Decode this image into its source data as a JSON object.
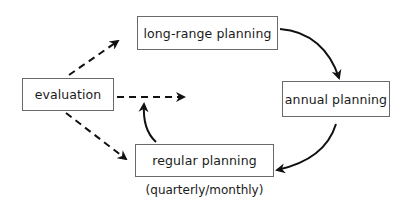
{
  "diagram": {
    "nodes": [
      {
        "id": "long_range",
        "label": "long-range planning"
      },
      {
        "id": "evaluation",
        "label": "evaluation"
      },
      {
        "id": "annual",
        "label": "annual planning"
      },
      {
        "id": "regular",
        "label": "regular planning"
      }
    ],
    "note": "(quarterly/monthly)",
    "edges": [
      {
        "from": "evaluation",
        "to": "long_range",
        "style": "dashed"
      },
      {
        "from": "evaluation",
        "to": "(open)",
        "style": "dashed"
      },
      {
        "from": "evaluation",
        "to": "regular",
        "style": "dashed"
      },
      {
        "from": "long_range",
        "to": "annual",
        "style": "solid-curved"
      },
      {
        "from": "annual",
        "to": "regular",
        "style": "solid-curved"
      },
      {
        "from": "regular",
        "to": "(open)",
        "style": "solid-curved"
      }
    ],
    "colors": {
      "line": "#111111",
      "border": "#6a6a6a",
      "background": "#ffffff"
    }
  }
}
